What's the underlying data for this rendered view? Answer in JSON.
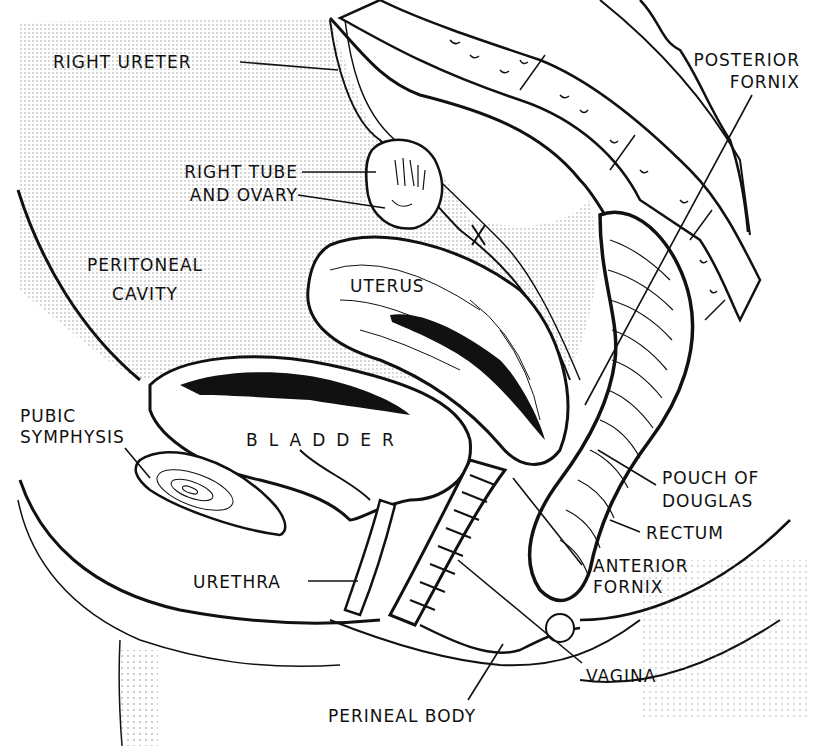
{
  "diagram": {
    "type": "anatomical sagittal section line illustration",
    "colors": {
      "ink": "#111111",
      "background": "#ffffff",
      "stipple": "#bdbdbd"
    },
    "labels": {
      "right_ureter": "RIGHT URETER",
      "right_tube_line1": "RIGHT TUBE",
      "right_tube_line2": "AND OVARY",
      "peritoneal_line1": "PERITONEAL",
      "peritoneal_line2": "CAVITY",
      "uterus": "UTERUS",
      "x_mark": "X",
      "posterior_fornix_line1": "POSTERIOR",
      "posterior_fornix_line2": "FORNIX",
      "pubic_line1": "PUBIC",
      "pubic_line2": "SYMPHYSIS",
      "bladder": "BLADDER",
      "pouch_line1": "POUCH OF",
      "pouch_line2": "DOUGLAS",
      "rectum": "RECTUM",
      "anterior_fornix_line1": "ANTERIOR",
      "anterior_fornix_line2": "FORNIX",
      "urethra": "URETHRA",
      "vagina": "VAGINA",
      "perineal_body": "PERINEAL BODY"
    }
  }
}
